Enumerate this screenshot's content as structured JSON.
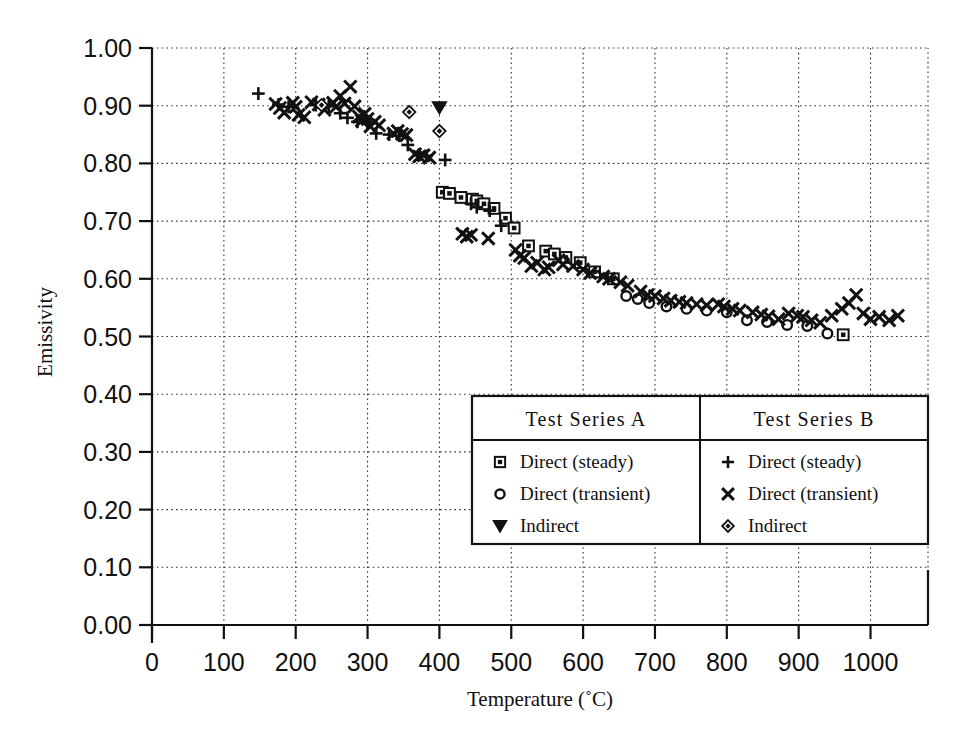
{
  "chart_data": {
    "type": "scatter",
    "title": "",
    "xlabel": "Temperature  (˚C)",
    "ylabel": "Emissivity",
    "xlim": [
      0,
      1080
    ],
    "ylim": [
      0.0,
      1.0
    ],
    "grid": true,
    "x_ticks": [
      0,
      100,
      200,
      300,
      400,
      500,
      600,
      700,
      800,
      900,
      1000
    ],
    "x_tick_labels": [
      "0",
      "100",
      "200",
      "300",
      "400",
      "500",
      "600",
      "700",
      "800",
      "900",
      "1000"
    ],
    "y_ticks": [
      0.0,
      0.1,
      0.2,
      0.3,
      0.4,
      0.5,
      0.6,
      0.7,
      0.8,
      0.9,
      1.0
    ],
    "y_tick_labels": [
      "0.00",
      "0.10",
      "0.20",
      "0.30",
      "0.40",
      "0.50",
      "0.60",
      "0.70",
      "0.80",
      "0.90",
      "1.00"
    ],
    "legend_position": "inside-lower-right",
    "series": [
      {
        "name": "Test Series A — Direct (steady)",
        "group": "A",
        "label": "Direct (steady)",
        "marker": "square",
        "points": [
          [
            404,
            0.75
          ],
          [
            414,
            0.748
          ],
          [
            430,
            0.741
          ],
          [
            446,
            0.738
          ],
          [
            452,
            0.735
          ],
          [
            462,
            0.73
          ],
          [
            476,
            0.722
          ],
          [
            492,
            0.705
          ],
          [
            504,
            0.688
          ],
          [
            524,
            0.657
          ],
          [
            548,
            0.648
          ],
          [
            560,
            0.643
          ],
          [
            576,
            0.637
          ],
          [
            596,
            0.628
          ],
          [
            616,
            0.612
          ],
          [
            642,
            0.6
          ],
          [
            962,
            0.503
          ]
        ]
      },
      {
        "name": "Test Series A — Direct (transient)",
        "group": "A",
        "label": "Direct (transient)",
        "marker": "circle",
        "points": [
          [
            660,
            0.57
          ],
          [
            676,
            0.565
          ],
          [
            692,
            0.558
          ],
          [
            716,
            0.552
          ],
          [
            744,
            0.548
          ],
          [
            772,
            0.545
          ],
          [
            800,
            0.542
          ],
          [
            828,
            0.528
          ],
          [
            856,
            0.525
          ],
          [
            884,
            0.52
          ],
          [
            912,
            0.518
          ],
          [
            940,
            0.505
          ]
        ]
      },
      {
        "name": "Test Series A — Indirect",
        "group": "A",
        "label": "Indirect",
        "marker": "triangle-down",
        "points": [
          [
            400,
            0.897
          ]
        ]
      },
      {
        "name": "Test Series B — Direct (steady)",
        "group": "B",
        "label": "Direct (steady)",
        "marker": "plus",
        "points": [
          [
            148,
            0.921
          ],
          [
            176,
            0.902
          ],
          [
            190,
            0.898
          ],
          [
            228,
            0.901
          ],
          [
            246,
            0.899
          ],
          [
            262,
            0.887
          ],
          [
            272,
            0.879
          ],
          [
            286,
            0.872
          ],
          [
            300,
            0.869
          ],
          [
            312,
            0.852
          ],
          [
            330,
            0.85
          ],
          [
            344,
            0.848
          ],
          [
            356,
            0.832
          ],
          [
            372,
            0.815
          ],
          [
            382,
            0.813
          ],
          [
            408,
            0.806
          ],
          [
            444,
            0.73
          ],
          [
            452,
            0.724
          ],
          [
            470,
            0.718
          ],
          [
            486,
            0.692
          ]
        ]
      },
      {
        "name": "Test Series B — Direct (transient)",
        "group": "B",
        "label": "Direct (transient)",
        "marker": "cross",
        "points": [
          [
            172,
            0.903
          ],
          [
            178,
            0.896
          ],
          [
            184,
            0.888
          ],
          [
            196,
            0.905
          ],
          [
            200,
            0.898
          ],
          [
            204,
            0.884
          ],
          [
            212,
            0.88
          ],
          [
            222,
            0.906
          ],
          [
            232,
            0.902
          ],
          [
            240,
            0.893
          ],
          [
            252,
            0.905
          ],
          [
            256,
            0.898
          ],
          [
            262,
            0.917
          ],
          [
            268,
            0.904
          ],
          [
            276,
            0.933
          ],
          [
            282,
            0.899
          ],
          [
            288,
            0.881
          ],
          [
            292,
            0.874
          ],
          [
            296,
            0.886
          ],
          [
            300,
            0.877
          ],
          [
            304,
            0.864
          ],
          [
            310,
            0.872
          ],
          [
            316,
            0.866
          ],
          [
            336,
            0.852
          ],
          [
            342,
            0.856
          ],
          [
            348,
            0.851
          ],
          [
            354,
            0.849
          ],
          [
            366,
            0.816
          ],
          [
            372,
            0.812
          ],
          [
            378,
            0.814
          ],
          [
            386,
            0.81
          ],
          [
            432,
            0.678
          ],
          [
            438,
            0.673
          ],
          [
            444,
            0.676
          ],
          [
            468,
            0.67
          ],
          [
            506,
            0.65
          ],
          [
            512,
            0.64
          ],
          [
            518,
            0.636
          ],
          [
            528,
            0.622
          ],
          [
            536,
            0.628
          ],
          [
            546,
            0.616
          ],
          [
            552,
            0.62
          ],
          [
            566,
            0.632
          ],
          [
            572,
            0.625
          ],
          [
            586,
            0.622
          ],
          [
            600,
            0.616
          ],
          [
            610,
            0.61
          ],
          [
            628,
            0.604
          ],
          [
            636,
            0.6
          ],
          [
            652,
            0.594
          ],
          [
            662,
            0.588
          ],
          [
            680,
            0.578
          ],
          [
            690,
            0.572
          ],
          [
            700,
            0.57
          ],
          [
            712,
            0.566
          ],
          [
            722,
            0.562
          ],
          [
            734,
            0.56
          ],
          [
            744,
            0.558
          ],
          [
            758,
            0.556
          ],
          [
            772,
            0.554
          ],
          [
            788,
            0.556
          ],
          [
            796,
            0.552
          ],
          [
            808,
            0.548
          ],
          [
            818,
            0.545
          ],
          [
            836,
            0.542
          ],
          [
            848,
            0.538
          ],
          [
            858,
            0.535
          ],
          [
            872,
            0.53
          ],
          [
            886,
            0.54
          ],
          [
            898,
            0.536
          ],
          [
            906,
            0.534
          ],
          [
            918,
            0.528
          ],
          [
            930,
            0.524
          ],
          [
            946,
            0.536
          ],
          [
            960,
            0.548
          ],
          [
            970,
            0.558
          ],
          [
            980,
            0.572
          ],
          [
            990,
            0.54
          ],
          [
            1000,
            0.53
          ],
          [
            1012,
            0.534
          ],
          [
            1026,
            0.528
          ],
          [
            1038,
            0.536
          ]
        ]
      },
      {
        "name": "Test Series B — Indirect",
        "group": "B",
        "label": "Indirect",
        "marker": "diamond",
        "points": [
          [
            236,
            0.901
          ],
          [
            400,
            0.856
          ],
          [
            358,
            0.889
          ]
        ]
      }
    ]
  },
  "axes": {
    "y_label": "Emissivity",
    "x_label_main": "Temperature",
    "x_label_unit": "(˚C)",
    "degree_symbol": "˚"
  },
  "legend": {
    "columns": [
      {
        "header": "Test  Series  A",
        "entries": [
          {
            "marker": "square",
            "label": "Direct  (steady)"
          },
          {
            "marker": "circle",
            "label": "Direct  (transient)"
          },
          {
            "marker": "triangle-down",
            "label": "Indirect"
          }
        ]
      },
      {
        "header": "Test  Series  B",
        "entries": [
          {
            "marker": "plus",
            "label": "Direct  (steady)"
          },
          {
            "marker": "cross",
            "label": "Direct  (transient)"
          },
          {
            "marker": "diamond",
            "label": "Indirect"
          }
        ]
      }
    ]
  },
  "colors": {
    "ink": "#111111",
    "paper": "#ffffff",
    "grid": "#333333"
  }
}
